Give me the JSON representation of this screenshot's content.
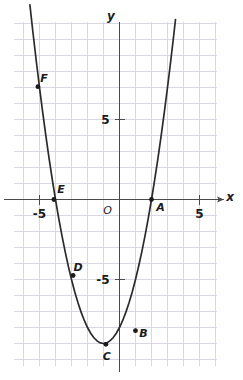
{
  "chart_data": {
    "type": "line",
    "title": "",
    "subtitle": "",
    "xlabel": "x",
    "ylabel": "y",
    "grid": true,
    "legend": "none",
    "xlim": [
      -6.6,
      6.1
    ],
    "ylim": [
      -10.4,
      11.1
    ],
    "x_ticks": [
      -5,
      5
    ],
    "x_tick_labels": [
      "-5",
      "5"
    ],
    "y_ticks": [
      5,
      -5
    ],
    "y_tick_labels": [
      "5",
      "-5"
    ],
    "origin_label": "O",
    "grid_step": 1,
    "function": "y = x^2 + 2x - 8",
    "series": [
      {
        "name": "parabola",
        "x": [
          -5.6,
          -5.4,
          -5.2,
          -5.0,
          -4.8,
          -4.6,
          -4.4,
          -4.2,
          -4.0,
          -3.8,
          -3.6,
          -3.4,
          -3.2,
          -3.0,
          -2.8,
          -2.6,
          -2.4,
          -2.2,
          -2.0,
          -1.8,
          -1.6,
          -1.4,
          -1.2,
          -1.0,
          -0.8,
          -0.6,
          -0.4,
          -0.2,
          0.0,
          0.2,
          0.4,
          0.6,
          0.8,
          1.0,
          1.2,
          1.4,
          1.6,
          1.8,
          2.0,
          2.2,
          2.4,
          2.6,
          2.8,
          3.0,
          3.2,
          3.4,
          3.5
        ],
        "y": [
          12.16,
          10.36,
          8.64,
          7.0,
          5.44,
          3.96,
          2.56,
          1.24,
          0.0,
          -1.16,
          -2.24,
          -3.24,
          -4.16,
          -5.0,
          -5.76,
          -6.44,
          -7.04,
          -7.56,
          -8.0,
          -8.36,
          -8.64,
          -8.84,
          -8.96,
          -9.0,
          -8.96,
          -8.84,
          -8.64,
          -8.36,
          -8.0,
          -7.56,
          -7.04,
          -6.44,
          -5.76,
          -5.0,
          -4.16,
          -3.24,
          -2.24,
          -1.16,
          0.0,
          1.24,
          2.56,
          3.96,
          5.44,
          7.0,
          8.64,
          10.36,
          11.25
        ]
      }
    ],
    "points": [
      {
        "label": "A",
        "x": 2,
        "y": 0,
        "label_dx": 9,
        "label_dy": 11
      },
      {
        "label": "B",
        "x": 1,
        "y": -8.2,
        "label_dx": 8,
        "label_dy": 6
      },
      {
        "label": "C",
        "x": -0.85,
        "y": -9.05,
        "label_dx": 1,
        "label_dy": 16
      },
      {
        "label": "D",
        "x": -2.9,
        "y": -4.75,
        "label_dx": 5,
        "label_dy": -5
      },
      {
        "label": "E",
        "x": -4.1,
        "y": 0,
        "label_dx": 7,
        "label_dy": -7
      },
      {
        "label": "F",
        "x": -5.1,
        "y": 7.05,
        "label_dx": 6,
        "label_dy": -5
      }
    ]
  }
}
